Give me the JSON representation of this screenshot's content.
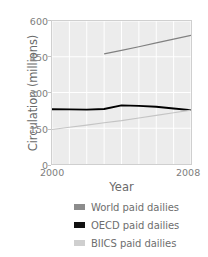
{
  "chart_data": {
    "type": "line",
    "title": "",
    "xlabel": "Year",
    "ylabel": "Circulation (millions)",
    "xlim": [
      2000,
      2008
    ],
    "ylim": [
      0,
      600
    ],
    "xticks": [
      "2000",
      "2008"
    ],
    "yticks": [
      "0",
      "150",
      "300",
      "450",
      "600"
    ],
    "grid": true,
    "legend_position": "bottom",
    "x": [
      2000,
      2001,
      2002,
      2003,
      2004,
      2005,
      2006,
      2007,
      2008
    ],
    "series": [
      {
        "name": "World paid dailies",
        "color": "#808080",
        "x": [
          2003,
          2004,
          2005,
          2006,
          2007,
          2008
        ],
        "values": [
          462,
          477,
          492,
          508,
          524,
          540
        ]
      },
      {
        "name": "OECD paid dailies",
        "color": "#000000",
        "x": [
          2000,
          2001,
          2002,
          2003,
          2004,
          2005,
          2006,
          2007,
          2008
        ],
        "values": [
          230,
          229,
          228,
          231,
          246,
          244,
          240,
          233,
          226
        ]
      },
      {
        "name": "BIICS paid dailies",
        "color": "#c4c4c4",
        "x": [
          2000,
          2001,
          2002,
          2003,
          2004,
          2005,
          2006,
          2007,
          2008
        ],
        "values": [
          145,
          154,
          163,
          173,
          182,
          193,
          204,
          215,
          226
        ]
      }
    ]
  },
  "axes": {
    "ylabel": "Circulation (millions)",
    "xlabel": "Year",
    "yticks": [
      {
        "label": "600",
        "value": 600
      },
      {
        "label": "450",
        "value": 450
      },
      {
        "label": "300",
        "value": 300
      },
      {
        "label": "150",
        "value": 150
      },
      {
        "label": "0",
        "value": 0
      }
    ],
    "xticks": [
      {
        "label": "2000",
        "value": 2000
      },
      {
        "label": "2008",
        "value": 2008
      }
    ]
  },
  "legend": {
    "items": [
      {
        "label": "World paid dailies",
        "color": "#8c8c8c"
      },
      {
        "label": "OECD paid dailies",
        "color": "#111111"
      },
      {
        "label": "BIICS paid dailies",
        "color": "#cfcfcf"
      }
    ]
  },
  "style": {
    "plot_background": "#ececec",
    "gridline_color": "#ffffff",
    "frame_color": "#cfcfcf",
    "text_color": "#6e6e6e"
  }
}
